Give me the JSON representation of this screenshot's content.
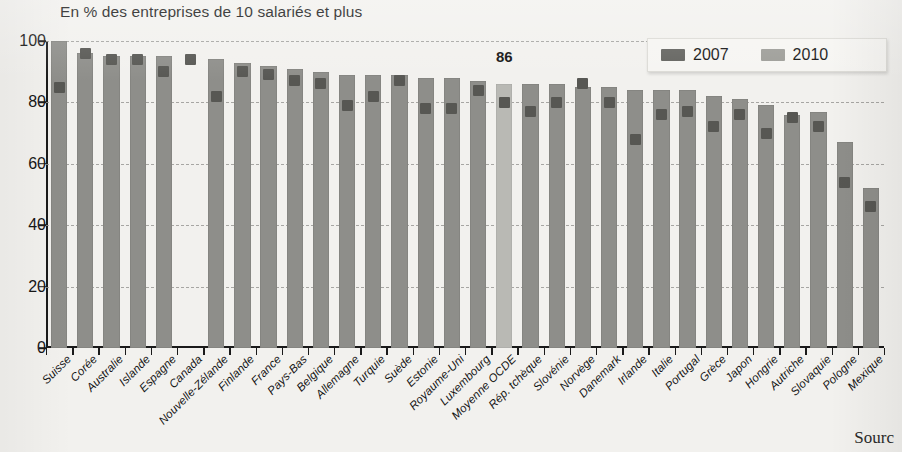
{
  "chart_data": {
    "type": "bar",
    "title": "En % des entreprises de 10 salariés et plus",
    "xlabel": "",
    "ylabel": "",
    "ylim": [
      0,
      100
    ],
    "yticks": [
      0,
      20,
      40,
      60,
      80,
      100
    ],
    "grid": true,
    "legend_position": "top-right",
    "categories": [
      "Suisse",
      "Corée",
      "Australie",
      "Islande",
      "Espagne",
      "Canada",
      "Nouvelle-Zélande",
      "Finlande",
      "France",
      "Pays-Bas",
      "Belgique",
      "Allemagne",
      "Turquie",
      "Suède",
      "Estonie",
      "Royaume-Uni",
      "Luxembourg",
      "Moyenne OCDE",
      "Rép. tchèque",
      "Slovénie",
      "Norvège",
      "Danemark",
      "Irlande",
      "Italie",
      "Portugal",
      "Grèce",
      "Japon",
      "Hongrie",
      "Autriche",
      "Slovaquie",
      "Pologne",
      "Mexique"
    ],
    "series": [
      {
        "name": "2010",
        "color": "#8e8e8a",
        "values": [
          100,
          96,
          95,
          95,
          95,
          null,
          94,
          93,
          92,
          91,
          90,
          89,
          89,
          89,
          88,
          88,
          87,
          86,
          86,
          86,
          85,
          85,
          84,
          84,
          84,
          82,
          81,
          79,
          76,
          77,
          67,
          52
        ]
      },
      {
        "name": "2007",
        "color": "#575753",
        "values": [
          85,
          96,
          94,
          94,
          90,
          94,
          82,
          90,
          89,
          87,
          86,
          79,
          82,
          87,
          78,
          78,
          84,
          80,
          77,
          80,
          86,
          80,
          68,
          76,
          77,
          72,
          76,
          70,
          75,
          72,
          54,
          46
        ]
      }
    ],
    "annotations": [
      {
        "text": "86",
        "category": "Moyenne OCDE",
        "value": 86
      }
    ],
    "highlight_category": "Moyenne OCDE",
    "highlight_color": "#b9b9b4"
  },
  "legend": {
    "items": [
      {
        "label": "2007",
        "color": "#63635f"
      },
      {
        "label": "2010",
        "color": "#9d9d98"
      }
    ]
  },
  "footer": {
    "source_text": "Sourc"
  }
}
